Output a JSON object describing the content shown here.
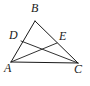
{
  "figure": {
    "kind": "geometry-diagram",
    "background_color": "#ffffff",
    "stroke_color": "#1a1a1a",
    "label_color": "#1a1a1a",
    "points": {
      "A": {
        "label": "A",
        "x": 11,
        "y": 62
      },
      "B": {
        "label": "B",
        "x": 35,
        "y": 21
      },
      "C": {
        "label": "C",
        "x": 78,
        "y": 63
      },
      "D": {
        "label": "D",
        "x": 21,
        "y": 41
      },
      "E": {
        "label": "E",
        "x": 57,
        "y": 43
      }
    },
    "segments": [
      {
        "name": "AB",
        "from": "A",
        "to": "B"
      },
      {
        "name": "BC",
        "from": "B",
        "to": "C"
      },
      {
        "name": "AC",
        "from": "A",
        "to": "C"
      },
      {
        "name": "DC",
        "from": "D",
        "to": "C"
      },
      {
        "name": "AE",
        "from": "A",
        "to": "E"
      }
    ]
  }
}
